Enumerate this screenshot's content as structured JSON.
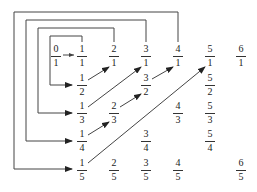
{
  "diagram": {
    "colors": {
      "line": "#444444",
      "text": "#222222",
      "background": "#ffffff"
    },
    "fractions": [
      {
        "id": "0-1",
        "num": "0",
        "den": "1",
        "x": 56,
        "y": 44
      },
      {
        "id": "1-1",
        "num": "1",
        "den": "1",
        "x": 82,
        "y": 44
      },
      {
        "id": "2-1",
        "num": "2",
        "den": "1",
        "x": 114,
        "y": 44
      },
      {
        "id": "3-1",
        "num": "3",
        "den": "1",
        "x": 146,
        "y": 44
      },
      {
        "id": "4-1",
        "num": "4",
        "den": "1",
        "x": 178,
        "y": 44
      },
      {
        "id": "5-1",
        "num": "5",
        "den": "1",
        "x": 210,
        "y": 44
      },
      {
        "id": "6-1",
        "num": "6",
        "den": "1",
        "x": 241,
        "y": 44
      },
      {
        "id": "1-2",
        "num": "1",
        "den": "2",
        "x": 82,
        "y": 73
      },
      {
        "id": "3-2",
        "num": "3",
        "den": "2",
        "x": 146,
        "y": 73
      },
      {
        "id": "5-2",
        "num": "5",
        "den": "2",
        "x": 210,
        "y": 73
      },
      {
        "id": "1-3",
        "num": "1",
        "den": "3",
        "x": 82,
        "y": 101
      },
      {
        "id": "2-3",
        "num": "2",
        "den": "3",
        "x": 114,
        "y": 101
      },
      {
        "id": "4-3",
        "num": "4",
        "den": "3",
        "x": 178,
        "y": 101
      },
      {
        "id": "5-3",
        "num": "5",
        "den": "3",
        "x": 210,
        "y": 101
      },
      {
        "id": "1-4",
        "num": "1",
        "den": "4",
        "x": 82,
        "y": 129
      },
      {
        "id": "3-4",
        "num": "3",
        "den": "4",
        "x": 146,
        "y": 129
      },
      {
        "id": "5-4",
        "num": "5",
        "den": "4",
        "x": 210,
        "y": 129
      },
      {
        "id": "1-5",
        "num": "1",
        "den": "5",
        "x": 82,
        "y": 158
      },
      {
        "id": "2-5",
        "num": "2",
        "den": "5",
        "x": 114,
        "y": 158
      },
      {
        "id": "3-5",
        "num": "3",
        "den": "5",
        "x": 146,
        "y": 158
      },
      {
        "id": "4-5",
        "num": "4",
        "den": "5",
        "x": 178,
        "y": 158
      },
      {
        "id": "6-5",
        "num": "6",
        "den": "5",
        "x": 241,
        "y": 158
      }
    ],
    "connectors": [
      {
        "from": "0/1",
        "to": "1/1",
        "kind": "short-arrow"
      },
      {
        "from": "1/1",
        "to": "1/2",
        "kind": "box-loop"
      },
      {
        "from": "1/2",
        "to": "2/1",
        "kind": "diagonal-arrow"
      },
      {
        "from": "2/1",
        "to": "1/3",
        "kind": "box-loop"
      },
      {
        "from": "1/3",
        "to": "3/1",
        "kind": "diagonal-arrow"
      },
      {
        "from": "3/1",
        "to": "1/4",
        "kind": "box-loop"
      },
      {
        "from": "1/4",
        "to": "2/3",
        "kind": "diagonal-arrow"
      },
      {
        "from": "2/3",
        "to": "3/2",
        "kind": "diagonal-arrow"
      },
      {
        "from": "3/2",
        "to": "4/1",
        "kind": "diagonal-arrow"
      },
      {
        "from": "4/1",
        "to": "1/5",
        "kind": "box-loop"
      },
      {
        "from": "1/5",
        "to": "5/1",
        "kind": "diagonal-arrow"
      }
    ]
  }
}
